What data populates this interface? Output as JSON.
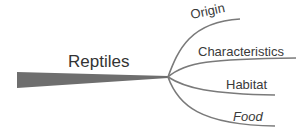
{
  "mindmap": {
    "central": {
      "label": "Reptiles"
    },
    "branches": [
      {
        "label": "Origin"
      },
      {
        "label": "Characteristics"
      },
      {
        "label": "Habitat"
      },
      {
        "label": "Food"
      }
    ]
  },
  "colors": {
    "trunk": "#6e6e6e",
    "branch": "#7a7a7a",
    "text": "#3a3a3a",
    "background": "#ffffff"
  }
}
